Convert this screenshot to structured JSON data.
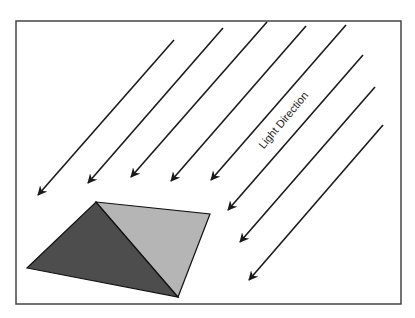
{
  "diagram": {
    "label": "Light Direction",
    "label_position": {
      "x": 283,
      "y": 120,
      "rotation_deg": -50
    },
    "frame": {
      "x": 16,
      "y": 21,
      "width": 385,
      "height": 283,
      "stroke": "#444444"
    },
    "colors": {
      "arrow": "#1a1a1a",
      "shaded_face": "#4d4d4d",
      "lit_face": "#b5b5b5",
      "edge": "#111111"
    },
    "arrows": [
      {
        "x1": 174,
        "y1": 40,
        "x2": 38,
        "y2": 195
      },
      {
        "x1": 223,
        "y1": 28,
        "x2": 88,
        "y2": 183
      },
      {
        "x1": 267,
        "y1": 22,
        "x2": 131,
        "y2": 177
      },
      {
        "x1": 306,
        "y1": 26,
        "x2": 171,
        "y2": 181
      },
      {
        "x1": 346,
        "y1": 25,
        "x2": 211,
        "y2": 180
      },
      {
        "x1": 363,
        "y1": 55,
        "x2": 228,
        "y2": 210
      },
      {
        "x1": 375,
        "y1": 87,
        "x2": 240,
        "y2": 242
      },
      {
        "x1": 383,
        "y1": 125,
        "x2": 249,
        "y2": 280
      }
    ],
    "pyramid": {
      "apex": [
        96,
        202
      ],
      "right": [
        210,
        214
      ],
      "bottom": [
        178,
        297
      ],
      "left": [
        27,
        268
      ]
    }
  }
}
